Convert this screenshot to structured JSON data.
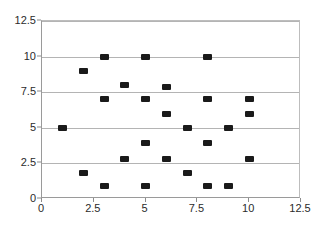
{
  "chart_data": {
    "type": "scatter",
    "title": "",
    "xlabel": "",
    "ylabel": "",
    "xlim": [
      0,
      12.5
    ],
    "ylim": [
      0,
      12.5
    ],
    "grid": true,
    "legend": false,
    "xticks": [
      "0",
      "2.5",
      "5",
      "7.5",
      "10",
      "12.5"
    ],
    "xtick_values": [
      0,
      2.5,
      5,
      7.5,
      10,
      12.5
    ],
    "yticks": [
      "0",
      "2.5",
      "5",
      "7.5",
      "10",
      "12.5"
    ],
    "ytick_values": [
      0,
      2.5,
      5,
      7.5,
      10,
      12.5
    ],
    "marker": "square",
    "marker_color": "#1a1a1a",
    "series": [
      {
        "name": "series-1",
        "points": [
          {
            "x": 1,
            "y": 5
          },
          {
            "x": 2,
            "y": 9
          },
          {
            "x": 2,
            "y": 1.8
          },
          {
            "x": 3,
            "y": 10
          },
          {
            "x": 3,
            "y": 7
          },
          {
            "x": 3,
            "y": 0.9
          },
          {
            "x": 4,
            "y": 8
          },
          {
            "x": 4,
            "y": 2.8
          },
          {
            "x": 5,
            "y": 10
          },
          {
            "x": 5,
            "y": 7
          },
          {
            "x": 5,
            "y": 3.9
          },
          {
            "x": 5,
            "y": 0.9
          },
          {
            "x": 6,
            "y": 7.9
          },
          {
            "x": 6,
            "y": 6
          },
          {
            "x": 6,
            "y": 2.8
          },
          {
            "x": 7,
            "y": 5
          },
          {
            "x": 7,
            "y": 1.8
          },
          {
            "x": 8,
            "y": 10
          },
          {
            "x": 8,
            "y": 7
          },
          {
            "x": 8,
            "y": 3.9
          },
          {
            "x": 8,
            "y": 0.9
          },
          {
            "x": 9,
            "y": 5
          },
          {
            "x": 9,
            "y": 0.9
          },
          {
            "x": 10,
            "y": 7
          },
          {
            "x": 10,
            "y": 6
          },
          {
            "x": 10,
            "y": 2.8
          }
        ]
      }
    ]
  }
}
